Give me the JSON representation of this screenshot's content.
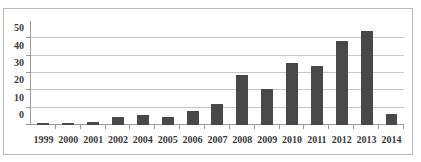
{
  "chart_data": {
    "type": "bar",
    "title": "",
    "subtitle": "",
    "xlabel": "",
    "ylabel": "",
    "categories": [
      "1999",
      "2000",
      "2001",
      "2002",
      "2004",
      "2005",
      "2006",
      "2007",
      "2008",
      "2009",
      "2010",
      "2011",
      "2012",
      "2013",
      "2014"
    ],
    "values": [
      1,
      1,
      2,
      4.5,
      5.5,
      4.5,
      8,
      12,
      29,
      21,
      36,
      34,
      48.5,
      54.5,
      6.5
    ],
    "series": [
      {
        "name": "Publications",
        "values": [
          1,
          1,
          2,
          4.5,
          5.5,
          4.5,
          8,
          12,
          29,
          21,
          36,
          34,
          48.5,
          54.5,
          6.5
        ]
      }
    ],
    "ylim": [
      0,
      60
    ],
    "y_ticks": [
      0,
      10,
      20,
      30,
      40,
      50
    ],
    "y_tick_labels": [
      "0",
      "10",
      "20",
      "30",
      "40",
      "50"
    ],
    "grid": "horizontal",
    "legend": "none",
    "bar_color": "#484848",
    "gridline_color": "#c6c6c6",
    "axis_color": "#9a9a9a",
    "plot_background": "#ffffff",
    "border_color": "#b9b9b9",
    "annotations": []
  }
}
